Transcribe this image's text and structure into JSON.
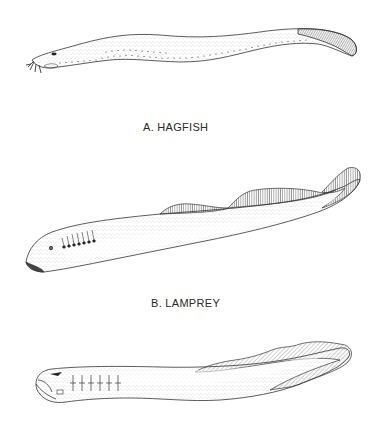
{
  "figure": {
    "panels": [
      {
        "id": "A",
        "label": "A. HAGFISH"
      },
      {
        "id": "B",
        "label": "B. LAMPREY"
      },
      {
        "id": "C",
        "label": ""
      }
    ]
  },
  "colors": {
    "background": "#ffffff",
    "ink": "#2a2a2a",
    "stipple": "#6b6b6b"
  }
}
